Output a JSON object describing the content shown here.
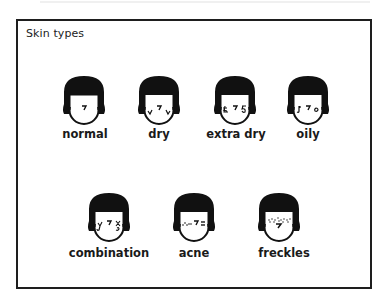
{
  "title": "Skin types",
  "colors": {
    "frame": "#1e1e1e",
    "hair": "#111111",
    "face": "#ffffff",
    "text": "#1a1a1a"
  },
  "skin_types": [
    {
      "label": "normal",
      "marks": "none"
    },
    {
      "label": "dry",
      "marks": "dry-lines"
    },
    {
      "label": "extra dry",
      "marks": "extra-dry-lines"
    },
    {
      "label": "oily",
      "marks": "oil-drops"
    },
    {
      "label": "combination",
      "marks": "mixed-marks"
    },
    {
      "label": "acne",
      "marks": "spots"
    },
    {
      "label": "freckles",
      "marks": "freckle-dots"
    }
  ]
}
